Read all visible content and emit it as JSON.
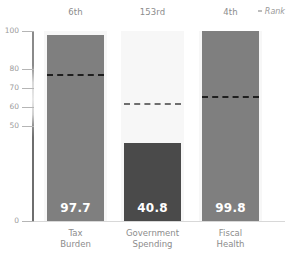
{
  "chart_data": {
    "type": "bar",
    "title": "",
    "subtitle": "",
    "xlabel": "",
    "ylabel": "",
    "ylim": [
      0,
      100
    ],
    "grid": false,
    "legend_position": "top-right",
    "legend_entries": [
      "Rank"
    ],
    "y_ticks": [
      {
        "value": 100,
        "label": "100"
      },
      {
        "value": 80,
        "label": "80"
      },
      {
        "value": 70,
        "label": "70"
      },
      {
        "value": 60,
        "label": "60"
      },
      {
        "value": 50,
        "label": "50"
      },
      {
        "value": 0,
        "label": "0"
      }
    ],
    "categories": [
      "Tax\nBurden",
      "Government\nSpending",
      "Fiscal\nHealth"
    ],
    "values": [
      97.7,
      40.8,
      99.8
    ],
    "value_labels": [
      "97.7",
      "40.8",
      "99.8"
    ],
    "ranks": [
      "6th",
      "153rd",
      "4th"
    ],
    "reference_lines": [
      77.5,
      62.0,
      66.0
    ],
    "bar_colors": [
      "#7f7f7f",
      "#4a4a4a",
      "#7f7f7f"
    ],
    "reference_line_color": "#1f1f1f",
    "axis_color": "#8a8a8a",
    "background_color": "#ffffff",
    "well_color": "#f7f7f7",
    "value_label_color": "#ffffff"
  },
  "header": {
    "rank_legend_label": "Rank"
  }
}
